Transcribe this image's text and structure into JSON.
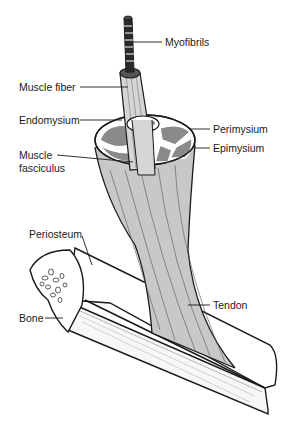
{
  "diagram": {
    "colors": {
      "background": "#ffffff",
      "outline": "#1a1a1a",
      "muscle_fill": "#c8c8c8",
      "fascicle_fill": "#8a8a8a",
      "bone_fill": "#ffffff"
    },
    "labels": {
      "myofibrils": "Myofibrils",
      "muscle_fiber": "Muscle fiber",
      "endomysium": "Endomysium",
      "perimysium": "Perimysium",
      "epimysium": "Epimysium",
      "muscle_fasciculus_line1": "Muscle",
      "muscle_fasciculus_line2": "fasciculus",
      "periosteum": "Periosteum",
      "bone": "Bone",
      "tendon": "Tendon"
    }
  }
}
